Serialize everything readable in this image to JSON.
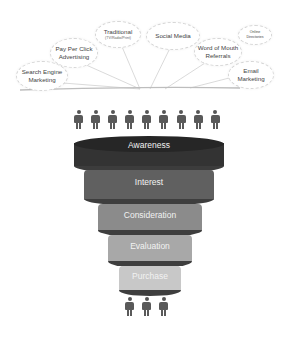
{
  "channels": [
    {
      "label_line1": "Search Engine",
      "label_line2": "Marketing"
    },
    {
      "label_line1": "Pay Per Click",
      "label_line2": "Advertising"
    },
    {
      "label_line1": "Traditional",
      "label_line2": "(TV/Radio/Print)"
    },
    {
      "label_line1": "Social Media",
      "label_line2": ""
    },
    {
      "label_line1": "Word of Mouth",
      "label_line2": "Referrals"
    },
    {
      "label_line1": "Online",
      "label_line2": "Directories"
    },
    {
      "label_line1": "Email",
      "label_line2": "Marketing"
    }
  ],
  "funnel": {
    "top_people_count": 9,
    "bottom_people_count": 3,
    "stages": [
      {
        "label": "Awareness",
        "color": "#2f2f2f"
      },
      {
        "label": "Interest",
        "color": "#5e5e5e"
      },
      {
        "label": "Consideration",
        "color": "#8a8a8a"
      },
      {
        "label": "Evaluation",
        "color": "#a9a9a9"
      },
      {
        "label": "Purchase",
        "color": "#c9c9c9"
      }
    ]
  },
  "icons": {
    "person": "person-icon"
  }
}
